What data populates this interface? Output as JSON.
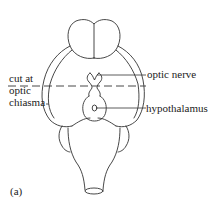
{
  "figure": {
    "panel_label": "(a)",
    "labels": {
      "cut_line_1": "cut at",
      "cut_line_2": "optic",
      "cut_line_3": "chiasma",
      "optic_nerve": "optic nerve",
      "hypothalamus": "hypothalamus"
    }
  }
}
